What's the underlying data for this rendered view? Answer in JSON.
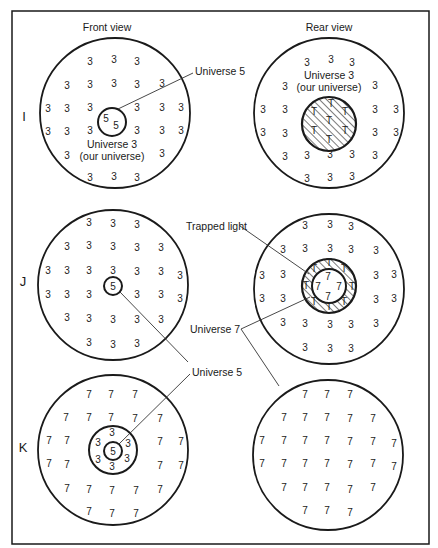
{
  "headers": {
    "front": "Front view",
    "rear": "Rear view"
  },
  "rows": {
    "I": "I",
    "J": "J",
    "K": "K"
  },
  "labels": {
    "universe5_I": "Universe 5",
    "universe3_front_line1": "Universe 3",
    "universe3_front_line2": "(our universe)",
    "universe3_rear_line1": "Universe 3",
    "universe3_rear_line2": "(our universe)",
    "trapped_light": "Trapped light",
    "universe7": "Universe 7",
    "universe5_K": "Universe 5"
  },
  "glyphs": {
    "u3": "3",
    "u5": "5",
    "u7": "7",
    "trapped": "T"
  },
  "colors": {
    "ink": "#1a1a1a",
    "background": "#ffffff"
  }
}
